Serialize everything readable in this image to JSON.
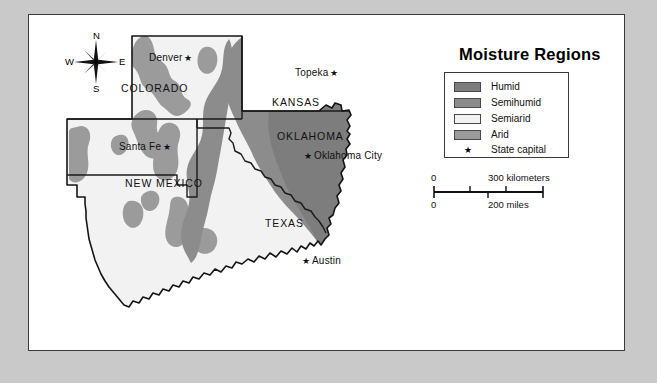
{
  "legend": {
    "title": "Moisture Regions",
    "items": [
      {
        "label": "Humid",
        "color": "#7d7d7d",
        "type": "swatch"
      },
      {
        "label": "Semihumid",
        "color": "#8c8c8c",
        "type": "swatch"
      },
      {
        "label": "Semiarid",
        "color": "#f2f2f2",
        "type": "swatch"
      },
      {
        "label": "Arid",
        "color": "#9b9b9b",
        "type": "swatch"
      },
      {
        "label": "State capital",
        "glyph": "★",
        "type": "symbol"
      }
    ]
  },
  "compass": {
    "north": "N",
    "east": "E",
    "south": "S",
    "west": "W"
  },
  "scale": {
    "km_zero": "0",
    "km_label": "300 kilometers",
    "mi_zero": "0",
    "mi_label": "200 miles"
  },
  "states": [
    {
      "name": "COLORADO",
      "x": 92,
      "y": 68
    },
    {
      "name": "KANSAS",
      "x": 243,
      "y": 82
    },
    {
      "name": "OKLAHOMA",
      "x": 248,
      "y": 116
    },
    {
      "name": "NEW MEXICO",
      "x": 96,
      "y": 163
    },
    {
      "name": "TEXAS",
      "x": 236,
      "y": 203
    }
  ],
  "capitals": [
    {
      "name": "Denver",
      "star": "★",
      "x": 120,
      "y": 38,
      "star_side": "right"
    },
    {
      "name": "Topeka",
      "star": "★",
      "x": 266,
      "y": 53,
      "star_side": "right"
    },
    {
      "name": "Santa Fe",
      "star": "★",
      "x": 90,
      "y": 127,
      "star_side": "right"
    },
    {
      "name": "Oklahoma City",
      "star": "★",
      "x": 275,
      "y": 136,
      "star_side": "left"
    },
    {
      "name": "Austin",
      "star": "★",
      "x": 273,
      "y": 241,
      "star_side": "left"
    }
  ],
  "colors": {
    "page_background": "#c9c9c9",
    "panel_background": "#ffffff",
    "humid": "#7d7d7d",
    "semihumid": "#8c8c8c",
    "semiarid": "#f2f2f2",
    "arid": "#9b9b9b",
    "outline": "#141414",
    "state_border": "#1b1b1b"
  },
  "chart_data": {
    "type": "map",
    "title": "Moisture Regions",
    "region": "Southwestern / South-Central United States",
    "classes": [
      "Humid",
      "Semihumid",
      "Semiarid",
      "Arid"
    ],
    "states_mapped": [
      "COLORADO",
      "KANSAS",
      "OKLAHOMA",
      "NEW MEXICO",
      "TEXAS"
    ],
    "capitals_mapped": [
      "Denver",
      "Topeka",
      "Santa Fe",
      "Oklahoma City",
      "Austin"
    ],
    "scale_bar": {
      "kilometers": 300,
      "miles": 200
    },
    "legend_position": "top-right"
  }
}
